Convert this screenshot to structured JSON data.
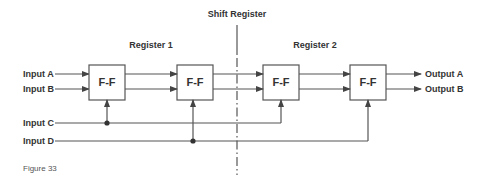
{
  "diagram": {
    "title": "Shift Register",
    "groups": [
      {
        "id": "register-1",
        "label": "Register 1"
      },
      {
        "id": "register-2",
        "label": "Register 2"
      }
    ],
    "flip_flops": [
      {
        "id": "ff1",
        "label": "F-F",
        "group": "register-1"
      },
      {
        "id": "ff2",
        "label": "F-F",
        "group": "register-1"
      },
      {
        "id": "ff3",
        "label": "F-F",
        "group": "register-2"
      },
      {
        "id": "ff4",
        "label": "F-F",
        "group": "register-2"
      }
    ],
    "inputs": [
      {
        "id": "input-a",
        "label": "Input A"
      },
      {
        "id": "input-b",
        "label": "Input B"
      },
      {
        "id": "input-c",
        "label": "Input C"
      },
      {
        "id": "input-d",
        "label": "Input D"
      }
    ],
    "outputs": [
      {
        "id": "output-a",
        "label": "Output A"
      },
      {
        "id": "output-b",
        "label": "Output B"
      }
    ],
    "connections": [
      {
        "from": "input-a",
        "to": "ff1"
      },
      {
        "from": "input-b",
        "to": "ff1"
      },
      {
        "from": "ff1",
        "to": "ff2",
        "lines": 2
      },
      {
        "from": "ff2",
        "to": "ff3",
        "lines": 2
      },
      {
        "from": "ff3",
        "to": "ff4",
        "lines": 2
      },
      {
        "from": "ff4",
        "to": "output-a"
      },
      {
        "from": "ff4",
        "to": "output-b"
      },
      {
        "from": "input-c",
        "to": "ff1",
        "type": "clock"
      },
      {
        "from": "input-c",
        "to": "ff3",
        "type": "clock"
      },
      {
        "from": "input-d",
        "to": "ff2",
        "type": "clock"
      },
      {
        "from": "input-d",
        "to": "ff4",
        "type": "clock"
      }
    ],
    "caption": "Figure 33"
  },
  "colors": {
    "line": "#555555",
    "text": "#333333",
    "background": "#ffffff"
  }
}
